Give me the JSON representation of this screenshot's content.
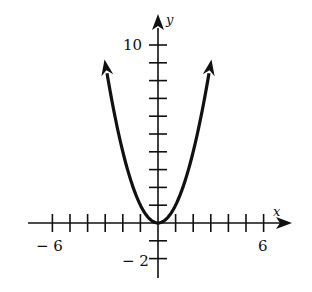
{
  "chart_data": {
    "type": "line",
    "title": "",
    "xlabel": "x",
    "ylabel": "y",
    "function": "y = x^2",
    "xlim": [
      -7,
      7
    ],
    "ylim": [
      -3,
      11
    ],
    "x_ticks": [
      -6,
      -5,
      -4,
      -3,
      -2,
      -1,
      1,
      2,
      3,
      4,
      5,
      6
    ],
    "y_ticks": [
      -2,
      -1,
      1,
      2,
      3,
      4,
      5,
      6,
      7,
      8,
      9,
      10
    ],
    "x_tick_labels": [
      {
        "value": -6,
        "label": "− 6"
      },
      {
        "value": 6,
        "label": "6"
      }
    ],
    "y_tick_labels": [
      {
        "value": 10,
        "label": "10"
      },
      {
        "value": -2,
        "label": "− 2"
      }
    ],
    "series": [
      {
        "name": "parabola",
        "x": [
          -2.9,
          -2.5,
          -2,
          -1.5,
          -1,
          -0.5,
          0,
          0.5,
          1,
          1.5,
          2,
          2.5,
          2.9
        ],
        "y": [
          8.41,
          6.25,
          4,
          2.25,
          1,
          0.25,
          0,
          0.25,
          1,
          2.25,
          4,
          6.25,
          8.41
        ],
        "color": "#111111",
        "arrows_at_ends": true
      }
    ],
    "grid": false,
    "legend": null
  },
  "labels": {
    "x_axis": "x",
    "y_axis": "y",
    "x_min_label": "− 6",
    "x_max_label": "6",
    "y_max_label": "10",
    "y_min_label": "− 2"
  }
}
